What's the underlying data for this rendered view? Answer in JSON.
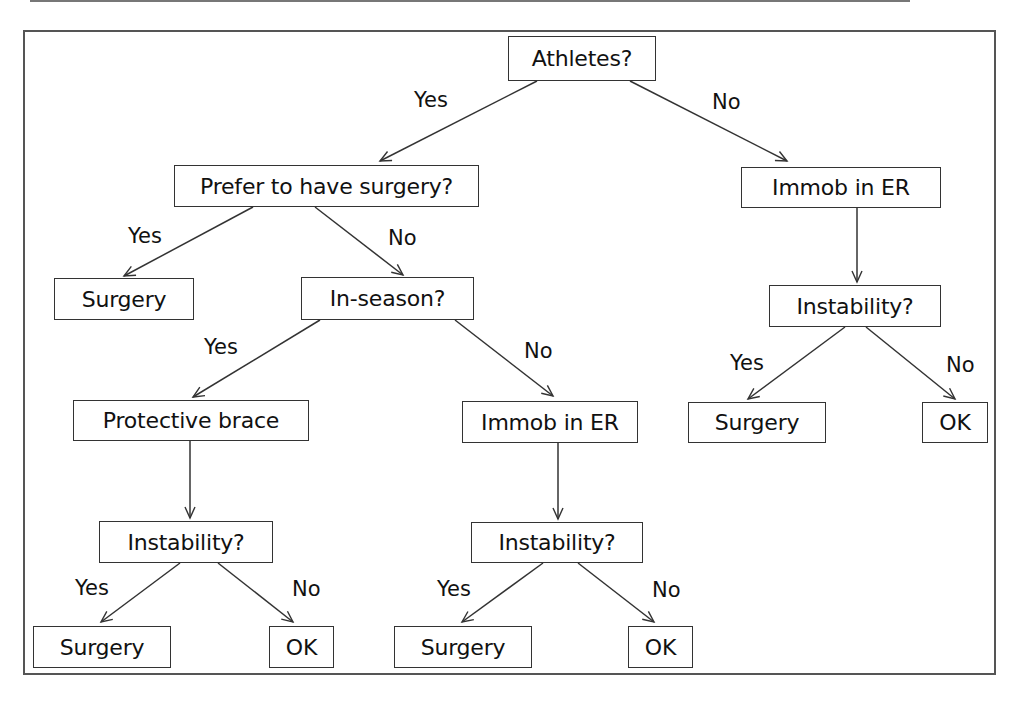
{
  "page": {
    "header_text": "",
    "colors": {
      "line": "#333333",
      "frame": "#555555",
      "background": "#ffffff",
      "text": "#111111"
    }
  },
  "flowchart": {
    "nodes": {
      "athletes": "Athletes?",
      "prefer_surgery": "Prefer to have surgery?",
      "immob_er_nonathlete": "Immob in ER",
      "surgery_prefer": "Surgery",
      "in_season": "In-season?",
      "protective_brace": "Protective brace",
      "immob_er_offseason": "Immob in ER",
      "instability_nonathlete": "Instability?",
      "surgery_nonathlete": "Surgery",
      "ok_nonathlete": "OK",
      "instability_brace": "Instability?",
      "surgery_brace": "Surgery",
      "ok_brace": "OK",
      "instability_offseason": "Instability?",
      "surgery_offseason": "Surgery",
      "ok_offseason": "OK"
    },
    "edge_labels": {
      "athletes_yes": "Yes",
      "athletes_no": "No",
      "prefer_yes": "Yes",
      "prefer_no": "No",
      "inseason_yes": "Yes",
      "inseason_no": "No",
      "instab_nonathlete_yes": "Yes",
      "instab_nonathlete_no": "No",
      "instab_brace_yes": "Yes",
      "instab_brace_no": "No",
      "instab_offseason_yes": "Yes",
      "instab_offseason_no": "No"
    }
  }
}
